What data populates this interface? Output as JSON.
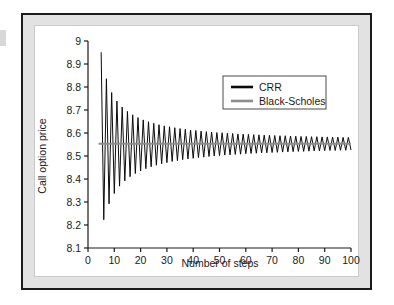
{
  "figure": {
    "frame_color": "#1b1b1b",
    "mat_color": "#e2e2e2",
    "plot_background": "#ffffff"
  },
  "chart_data": {
    "type": "line",
    "title": "",
    "xlabel": "Number of steps",
    "ylabel": "Call option price",
    "xlim": [
      0,
      100
    ],
    "ylim": [
      8.1,
      9.0
    ],
    "xticks": [
      0,
      10,
      20,
      30,
      40,
      50,
      60,
      70,
      80,
      90,
      100
    ],
    "xtick_labels": [
      "0",
      "10",
      "20",
      "30",
      "40",
      "50",
      "60",
      "70",
      "80",
      "90",
      "100"
    ],
    "yticks": [
      8.1,
      8.2,
      8.3,
      8.4,
      8.5,
      8.6,
      8.7,
      8.8,
      8.9,
      9.0
    ],
    "ytick_labels": [
      "8.1",
      "8.2",
      "8.3",
      "8.4",
      "8.5",
      "8.6",
      "8.7",
      "8.8",
      "8.9",
      "9"
    ],
    "grid": false,
    "legend_position": "upper right",
    "series": [
      {
        "name": "CRR",
        "color": "#0b0b0b",
        "linewidth": 1.0,
        "x": [
          5,
          6,
          7,
          8,
          9,
          10,
          11,
          12,
          13,
          14,
          15,
          16,
          17,
          18,
          19,
          20,
          21,
          22,
          23,
          24,
          25,
          26,
          27,
          28,
          29,
          30,
          31,
          32,
          33,
          34,
          35,
          36,
          37,
          38,
          39,
          40,
          41,
          42,
          43,
          44,
          45,
          46,
          47,
          48,
          49,
          50,
          51,
          52,
          53,
          54,
          55,
          56,
          57,
          58,
          59,
          60,
          61,
          62,
          63,
          64,
          65,
          66,
          67,
          68,
          69,
          70,
          71,
          72,
          73,
          74,
          75,
          76,
          77,
          78,
          79,
          80,
          81,
          82,
          83,
          84,
          85,
          86,
          87,
          88,
          89,
          90,
          91,
          92,
          93,
          94,
          95,
          96,
          97,
          98,
          99,
          100
        ],
        "values": [
          8.951,
          8.223,
          8.836,
          8.292,
          8.776,
          8.337,
          8.739,
          8.369,
          8.713,
          8.392,
          8.694,
          8.41,
          8.679,
          8.424,
          8.667,
          8.435,
          8.657,
          8.445,
          8.649,
          8.453,
          8.642,
          8.46,
          8.636,
          8.466,
          8.631,
          8.471,
          8.627,
          8.476,
          8.623,
          8.48,
          8.619,
          8.484,
          8.616,
          8.487,
          8.613,
          8.49,
          8.611,
          8.493,
          8.608,
          8.495,
          8.606,
          8.498,
          8.604,
          8.5,
          8.602,
          8.502,
          8.601,
          8.504,
          8.599,
          8.505,
          8.598,
          8.507,
          8.596,
          8.508,
          8.595,
          8.51,
          8.594,
          8.511,
          8.593,
          8.512,
          8.592,
          8.513,
          8.591,
          8.514,
          8.59,
          8.515,
          8.589,
          8.516,
          8.588,
          8.517,
          8.588,
          8.518,
          8.587,
          8.519,
          8.586,
          8.52,
          8.585,
          8.52,
          8.585,
          8.521,
          8.584,
          8.522,
          8.584,
          8.522,
          8.583,
          8.523,
          8.583,
          8.524,
          8.582,
          8.524,
          8.582,
          8.525,
          8.581,
          8.525,
          8.581,
          8.526
        ]
      },
      {
        "name": "Black-Scholes",
        "color": "#8c8c8c",
        "linewidth": 2.0,
        "constant_value": 8.553
      }
    ]
  },
  "legend": {
    "items": [
      {
        "label": "CRR",
        "color": "#0b0b0b"
      },
      {
        "label": "Black-Scholes",
        "color": "#8c8c8c"
      }
    ]
  }
}
